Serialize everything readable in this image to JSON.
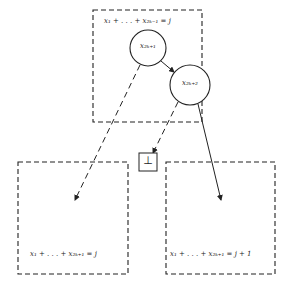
{
  "diagram": {
    "top_box": {
      "label": "x₁ + . . . + x₂ₖ₋₁ = j"
    },
    "node_a": {
      "label": "x₂ₖ₊₁"
    },
    "node_b": {
      "label": "x₂ₖ₊₂"
    },
    "bottom_symbol": "⊥",
    "left_box": {
      "label": "x₁ + . . . + x₂ₖ₊₁ = j"
    },
    "right_box": {
      "label": "x₁ + . . . + x₂ₖ₊₁ = j + 1"
    },
    "colors": {
      "stroke": "#222222",
      "background": "#ffffff"
    }
  }
}
